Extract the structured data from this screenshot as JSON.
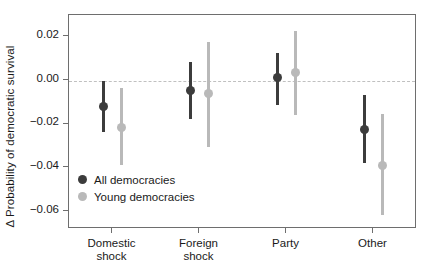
{
  "chart_data": {
    "type": "scatter",
    "title": "",
    "xlabel": "",
    "ylabel": "Δ Probability of democratic survival",
    "ylim": [
      -0.068,
      0.03
    ],
    "yticks": [
      0.02,
      0.0,
      -0.02,
      -0.04,
      -0.06
    ],
    "ytick_labels": [
      "0.02",
      "0.00",
      "-0.02",
      "-0.04",
      "-0.06"
    ],
    "categories": [
      "Domestic shock",
      "Foreign shock",
      "Party",
      "Other"
    ],
    "category_labels": [
      [
        "Domestic",
        "shock"
      ],
      [
        "Foreign",
        "shock"
      ],
      [
        "Party",
        ""
      ],
      [
        "Other",
        ""
      ]
    ],
    "grid": false,
    "reference_line": 0.0,
    "reference_line_style": "dashed",
    "legend_position": "inside-lower-left",
    "series": [
      {
        "name": "All democracies",
        "color": "#3c3c3c",
        "values": [
          -0.012,
          -0.0045,
          0.0012,
          -0.0225
        ],
        "low": [
          -0.0235,
          -0.0175,
          -0.011,
          -0.038
        ],
        "high": [
          0.0,
          0.0085,
          0.0125,
          -0.0065
        ]
      },
      {
        "name": "Young democracies",
        "color": "#b9b9b9",
        "values": [
          -0.0213,
          -0.006,
          0.0035,
          -0.039
        ],
        "low": [
          -0.0385,
          -0.0303,
          -0.016,
          -0.0615
        ],
        "high": [
          -0.0035,
          0.0175,
          0.0225,
          -0.0155
        ]
      }
    ]
  },
  "legend": {
    "items": [
      {
        "label": "All democracies",
        "color": "#3c3c3c"
      },
      {
        "label": "Young democracies",
        "color": "#b9b9b9"
      }
    ]
  },
  "axes": {
    "y_title": "Δ Probability of democratic survival"
  }
}
